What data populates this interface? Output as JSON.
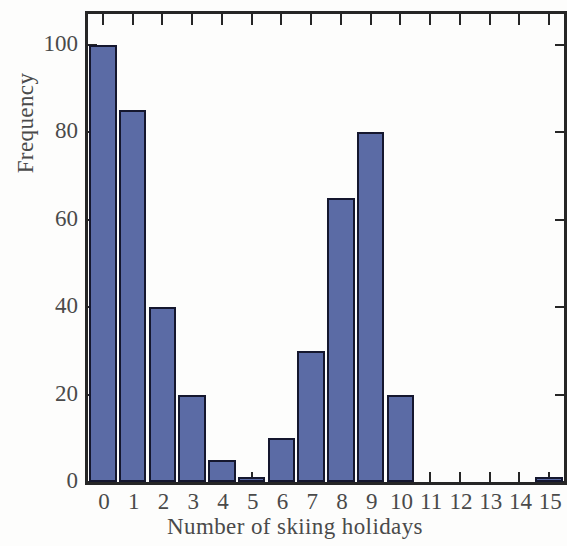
{
  "chart_data": {
    "type": "bar",
    "title": "",
    "subtitle": "",
    "xlabel": "Number of skiing holidays",
    "ylabel": "Frequency",
    "categories": [
      "0",
      "1",
      "2",
      "3",
      "4",
      "5",
      "6",
      "7",
      "8",
      "9",
      "10",
      "11",
      "12",
      "13",
      "14",
      "15"
    ],
    "values": [
      100,
      85,
      40,
      20,
      5,
      1,
      10,
      30,
      65,
      80,
      20,
      0,
      0,
      0,
      0,
      1
    ],
    "x_tick_labels": [
      "0",
      "1",
      "2",
      "3",
      "4",
      "5",
      "6",
      "7",
      "8",
      "9",
      "10",
      "11",
      "12",
      "13",
      "14",
      "15"
    ],
    "y_tick_labels": [
      "0",
      "20",
      "40",
      "60",
      "80",
      "100"
    ],
    "y_ticks": [
      0,
      20,
      40,
      60,
      80,
      100
    ],
    "ylim": [
      0,
      107
    ],
    "xlim": [
      -0.5,
      15.5
    ],
    "grid": false,
    "legend": null,
    "bar_fill_color": "#5b6ba5",
    "bar_edge_color": "#15172e",
    "axis_color": "#262626",
    "background_color": "#fdfdfc",
    "annotations": []
  }
}
